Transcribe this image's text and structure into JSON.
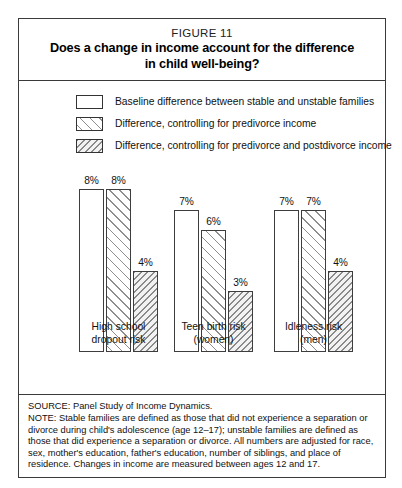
{
  "header": {
    "figure_number": "FIGURE 11",
    "title_line_1": "Does a change in income account for the difference",
    "title_line_2": "in child well-being?"
  },
  "legend": {
    "items": [
      {
        "swatch": "plain-white-swatch",
        "label": "Baseline difference between stable and unstable families"
      },
      {
        "swatch": "forward-hatch-swatch",
        "label": "Difference, controlling for predivorce income"
      },
      {
        "swatch": "back-hatch-swatch",
        "label": "Difference, controlling for predivorce and postdivorce income"
      }
    ]
  },
  "groups": [
    {
      "label_line_1": "High school",
      "label_line_2": "dropout risk",
      "bars": [
        {
          "value": 8,
          "label": "8%",
          "fill": "plain"
        },
        {
          "value": 8,
          "label": "8%",
          "fill": "fwd"
        },
        {
          "value": 4,
          "label": "4%",
          "fill": "back"
        }
      ]
    },
    {
      "label_line_1": "Teen birth risk",
      "label_line_2": "(women)",
      "bars": [
        {
          "value": 7,
          "label": "7%",
          "fill": "plain"
        },
        {
          "value": 6,
          "label": "6%",
          "fill": "fwd"
        },
        {
          "value": 3,
          "label": "3%",
          "fill": "back"
        }
      ]
    },
    {
      "label_line_1": "Idleness risk",
      "label_line_2": "(men)",
      "bars": [
        {
          "value": 7,
          "label": "7%",
          "fill": "plain"
        },
        {
          "value": 7,
          "label": "7%",
          "fill": "fwd"
        },
        {
          "value": 4,
          "label": "4%",
          "fill": "back"
        }
      ]
    }
  ],
  "footer": {
    "source": "SOURCE: Panel Study of Income Dynamics.",
    "note": "NOTE: Stable families are defined as those that did not experience a separation or divorce during child's adolescence (age 12–17); unstable families are defined as those that did experience a separation or divorce. All numbers are adjusted for race, sex, mother's education, father's education, number of siblings, and place of residence. Changes in income are measured between ages 12 and 17."
  },
  "chart_data": {
    "type": "bar",
    "title": "Does a change in income account for the difference in child well-being?",
    "subtitle": "FIGURE 11",
    "xlabel": "",
    "ylabel": "",
    "ylim": [
      0,
      9
    ],
    "grid": false,
    "legend_position": "top",
    "value_suffix": "%",
    "categories": [
      "High school dropout risk",
      "Teen birth risk (women)",
      "Idleness risk (men)"
    ],
    "series": [
      {
        "name": "Baseline difference between stable and unstable families",
        "values": [
          8,
          7,
          7
        ]
      },
      {
        "name": "Difference, controlling for predivorce income",
        "values": [
          8,
          6,
          7
        ]
      },
      {
        "name": "Difference, controlling for predivorce and postdivorce income",
        "values": [
          4,
          3,
          4
        ]
      }
    ]
  }
}
